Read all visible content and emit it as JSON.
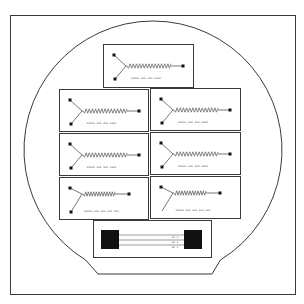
{
  "diagram": {
    "title": "",
    "type": "wafer-layout",
    "colors": {
      "background": "#ffffff",
      "stroke": "#3a3a3a",
      "pad": "#111111",
      "spring": "#555555",
      "label": "#444444"
    },
    "frame": {
      "x": 10,
      "y": 15,
      "width": 285,
      "height": 279
    },
    "wafer": {
      "cx": 153,
      "cy": 150,
      "r": 129,
      "flat_y": 274,
      "flat_x1": 98,
      "flat_x2": 212
    },
    "devices": [
      {
        "id": "d0",
        "x": 103,
        "y": 44,
        "w": 90,
        "h": 43,
        "label": "xxxxx xxx xxx xxxx",
        "layout": "centered",
        "has_bottom_pad": true
      },
      {
        "id": "d1",
        "x": 59,
        "y": 89,
        "w": 89,
        "h": 42,
        "label": "xxxxx xxx xxx xxxx",
        "layout": "centered",
        "has_bottom_pad": true
      },
      {
        "id": "d2",
        "x": 150,
        "y": 88,
        "w": 90,
        "h": 42,
        "label": "xxxxx xxx xxx xxxx",
        "layout": "centered",
        "has_bottom_pad": true
      },
      {
        "id": "d3",
        "x": 59,
        "y": 133,
        "w": 89,
        "h": 42,
        "label": "xxxxx xxx xxx xxxx",
        "layout": "centered",
        "has_bottom_pad": true
      },
      {
        "id": "d4",
        "x": 150,
        "y": 132,
        "w": 90,
        "h": 42,
        "label": "xxxxx xxx xxx xxxx",
        "layout": "centered",
        "has_bottom_pad": true
      },
      {
        "id": "d5",
        "x": 59,
        "y": 177,
        "w": 89,
        "h": 42,
        "label": "xxxxx xxx xxx xxx xxx",
        "layout": "high",
        "has_bottom_pad": true
      },
      {
        "id": "d6",
        "x": 150,
        "y": 176,
        "w": 90,
        "h": 42,
        "label": "xxxxx xxx xxx xxx xxx",
        "layout": "high",
        "has_bottom_pad": false
      }
    ],
    "test_structure": {
      "box": {
        "x": 93,
        "y": 220,
        "w": 118,
        "h": 37
      },
      "left_pad": {
        "x": 101,
        "y": 230,
        "w": 18,
        "h": 19
      },
      "right_pad": {
        "x": 184,
        "y": 230,
        "w": 18,
        "h": 19
      },
      "lines_y": [
        235,
        240,
        245
      ],
      "line_labels": [
        "xx x",
        "xx x",
        "xx x"
      ]
    }
  }
}
